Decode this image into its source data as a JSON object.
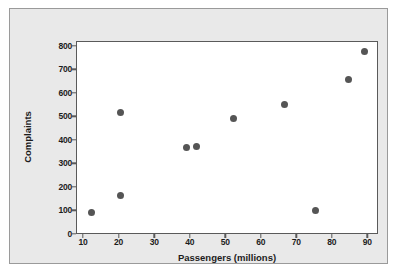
{
  "chart_data": {
    "type": "scatter",
    "title": "",
    "xlabel": "Passengers (millions)",
    "ylabel": "Complaints",
    "xlim": [
      8,
      93
    ],
    "ylim": [
      0,
      820
    ],
    "xticks": [
      10,
      20,
      30,
      40,
      50,
      60,
      70,
      80,
      90
    ],
    "xtick_labels": [
      "10",
      "20",
      "30",
      "40",
      "50",
      "60",
      "70",
      "80",
      "90"
    ],
    "yticks": [
      0,
      100,
      200,
      300,
      400,
      500,
      600,
      700,
      800
    ],
    "ytick_labels": [
      "0",
      "100",
      "200",
      "300",
      "400",
      "500",
      "600",
      "700",
      "800"
    ],
    "grid": false,
    "legend": false,
    "marker": "filled-circle",
    "marker_color": "#555555",
    "points": [
      {
        "x": 12.0,
        "y": 95
      },
      {
        "x": 20.2,
        "y": 520
      },
      {
        "x": 20.3,
        "y": 167
      },
      {
        "x": 38.9,
        "y": 370
      },
      {
        "x": 41.5,
        "y": 378
      },
      {
        "x": 52.0,
        "y": 493
      },
      {
        "x": 66.4,
        "y": 553
      },
      {
        "x": 75.0,
        "y": 102
      },
      {
        "x": 84.5,
        "y": 660
      },
      {
        "x": 88.8,
        "y": 780
      }
    ]
  },
  "figure": {
    "background_color": "#e9e9e9",
    "plot_background_color": "#ffffff",
    "axis_color": "#5a5a5a",
    "border_color": "#9a9a9a"
  }
}
